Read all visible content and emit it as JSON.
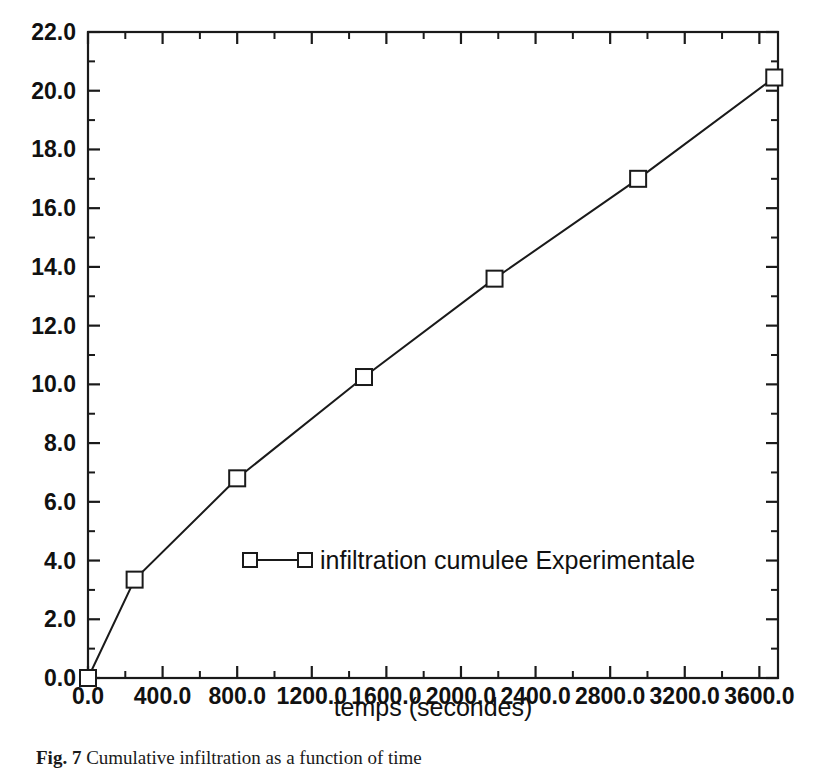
{
  "figure": {
    "caption_label": "Fig. 7",
    "caption_text": "Cumulative infiltration as a function of time",
    "background_color": "#ffffff",
    "ink_color": "#1a1a1a"
  },
  "chart_data": {
    "type": "line",
    "title": "",
    "xlabel": "temps (secondes)",
    "ylabel": "",
    "xlim": [
      0,
      3700
    ],
    "ylim": [
      0,
      22
    ],
    "grid": false,
    "legend_position": "inside-center-lower",
    "x_ticks": [
      "0.0",
      "400.0",
      "800.0",
      "1200.0",
      "1600.0",
      "2000.0",
      "2400.0",
      "2800.0",
      "3200.0",
      "3600.0"
    ],
    "x_tick_values": [
      0,
      400,
      800,
      1200,
      1600,
      2000,
      2400,
      2800,
      3200,
      3600
    ],
    "x_minor_step": 200,
    "y_ticks": [
      "0.0",
      "2.0",
      "4.0",
      "6.0",
      "8.0",
      "10.0",
      "12.0",
      "14.0",
      "16.0",
      "18.0",
      "20.0",
      "22.0"
    ],
    "y_tick_values": [
      0,
      2,
      4,
      6,
      8,
      10,
      12,
      14,
      16,
      18,
      20,
      22
    ],
    "y_minor_step": 1,
    "series": [
      {
        "name": "infiltration cumulee Experimentale",
        "marker": "open-square",
        "color": "#1a1a1a",
        "x": [
          0,
          250,
          800,
          1480,
          2180,
          2950,
          3680
        ],
        "values": [
          0.0,
          3.35,
          6.8,
          10.25,
          13.6,
          17.0,
          20.45
        ]
      }
    ]
  },
  "legend": {
    "entries": [
      {
        "label": "infiltration cumulee Experimentale",
        "marker": "open-square"
      }
    ]
  }
}
